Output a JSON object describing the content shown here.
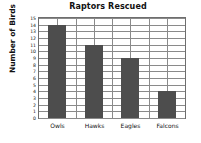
{
  "chart_data": {
    "type": "bar",
    "title": "Raptors Rescued",
    "xlabel": "",
    "ylabel": "Number of Birds",
    "categories": [
      "Owls",
      "Hawks",
      "Eagles",
      "Falcons"
    ],
    "values": [
      14,
      11,
      9,
      4
    ],
    "ylim": [
      0,
      15
    ],
    "ytick_labels": [
      "0",
      "1",
      "2",
      "3",
      "4",
      "5",
      "6",
      "7",
      "8",
      "9",
      "10",
      "11",
      "12",
      "13",
      "14",
      "15"
    ],
    "ytick_values": [
      0,
      1,
      2,
      3,
      4,
      5,
      6,
      7,
      8,
      9,
      10,
      11,
      12,
      13,
      14,
      15
    ],
    "grid": "horizontal-and-vertical",
    "legend": "none",
    "bar_color": "#4d4d4d",
    "grid_color": "#8a8a8a",
    "frame_color": "#6e6e6e",
    "background_color": "#ffffff",
    "text_color": "#111111"
  }
}
